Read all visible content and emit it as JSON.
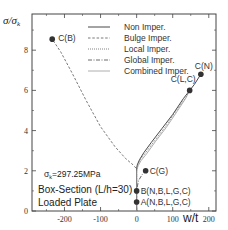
{
  "chart_data": {
    "type": "line",
    "title": "",
    "xlabel": "w/t",
    "ylabel": "σ/σk",
    "xlim": [
      -290,
      220
    ],
    "ylim": [
      0,
      9.8
    ],
    "x_ticks": [
      -200,
      -100,
      0,
      100,
      200
    ],
    "y_ticks": [
      0,
      2,
      4,
      6,
      8
    ],
    "grid": false,
    "legend_position": "upper right",
    "series": [
      {
        "name": "Non Imper.",
        "style": "solid",
        "x": [
          0,
          0,
          0,
          2,
          8,
          20,
          40,
          70,
          100,
          130,
          160,
          178
        ],
        "y": [
          0,
          1.0,
          2.1,
          2.3,
          2.55,
          2.9,
          3.4,
          4.1,
          4.8,
          5.6,
          6.3,
          6.8
        ]
      },
      {
        "name": "Bulge Imper.",
        "style": "dashed",
        "x": [
          0,
          0,
          -10,
          -30,
          -60,
          -100,
          -140,
          -180,
          -210,
          -234
        ],
        "y": [
          0,
          2.1,
          2.3,
          2.6,
          3.2,
          4.2,
          5.5,
          6.9,
          7.9,
          8.55
        ]
      },
      {
        "name": "Local Imper.",
        "style": "dotted",
        "x": [
          0,
          0,
          0,
          3,
          10,
          25,
          50,
          80,
          110,
          135,
          147
        ],
        "y": [
          0,
          1.0,
          2.05,
          2.3,
          2.55,
          2.9,
          3.5,
          4.2,
          5.0,
          5.6,
          6.0
        ]
      },
      {
        "name": "Global Imper.",
        "style": "dash-dot",
        "x": [
          0,
          0,
          5,
          15,
          25
        ],
        "y": [
          0,
          1.0,
          1.5,
          1.8,
          2.0
        ]
      },
      {
        "name": "Combined Imper.",
        "style": "solid-light",
        "x": [
          0,
          0,
          0,
          4,
          12,
          28,
          52,
          82,
          112,
          136,
          147
        ],
        "y": [
          0,
          1.0,
          2.0,
          2.25,
          2.5,
          2.85,
          3.45,
          4.15,
          4.95,
          5.6,
          6.0
        ]
      }
    ],
    "points": [
      {
        "label": "C(B)",
        "x": -234,
        "y": 8.55
      },
      {
        "label": "C(N)",
        "x": 178,
        "y": 6.8
      },
      {
        "label": "C(L,C)",
        "x": 147,
        "y": 6.0
      },
      {
        "label": "C(G)",
        "x": 25,
        "y": 2.0
      },
      {
        "label": "B(N,B,L,G,C)",
        "x": 0,
        "y": 1.0
      },
      {
        "label": "A(N,B,L,G,C)",
        "x": 0,
        "y": 0.45
      }
    ],
    "annotations": [
      "σk=297.25MPa",
      "Box-Section (L/h=30)",
      "Loaded Plate"
    ]
  },
  "labels": {
    "ylabel_main": "σ/σ",
    "ylabel_sub": "k",
    "xlabel": "w/t",
    "sigma_note": "σ",
    "sigma_note_sub": "k",
    "sigma_note_value": "=297.25MPa",
    "section": "Box-Section (L/h=30)",
    "plate": "Loaded Plate"
  }
}
